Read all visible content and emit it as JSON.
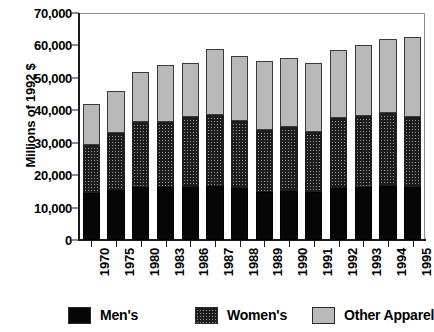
{
  "chart_data": {
    "type": "bar",
    "subtype": "stacked-vertical",
    "title": "",
    "xlabel": "",
    "ylabel": "Millions of 1992 $",
    "ylim": [
      0,
      70000
    ],
    "ytick_step": 10000,
    "ytick_labels": [
      "70,000",
      "60,000",
      "50,000",
      "40,000",
      "30,000",
      "20,000",
      "10,000",
      "0"
    ],
    "ytick_values": [
      70000,
      60000,
      50000,
      40000,
      30000,
      20000,
      10000,
      0
    ],
    "grid": false,
    "legend_position": "bottom",
    "categories": [
      "1970",
      "1975",
      "1980",
      "1983",
      "1986",
      "1987",
      "1988",
      "1989",
      "1990",
      "1991",
      "1992",
      "1993",
      "1994",
      "1995"
    ],
    "series": [
      {
        "name": "Men's",
        "pattern": "solid-black",
        "color": "#060606",
        "values": [
          14500,
          15500,
          16400,
          16300,
          16300,
          16800,
          16000,
          14800,
          15100,
          14900,
          16100,
          16300,
          16800,
          16200
        ]
      },
      {
        "name": "Women's",
        "pattern": "crosshatch",
        "color": "#9a9a9a",
        "values": [
          14900,
          17500,
          20100,
          20200,
          21700,
          21800,
          20800,
          19000,
          19900,
          18500,
          21500,
          21800,
          22400,
          21800
        ]
      },
      {
        "name": "Other Apparel",
        "pattern": "solid-lightgray",
        "color": "#b9b9b9",
        "values": [
          12400,
          13000,
          15300,
          17500,
          16500,
          20400,
          20000,
          21400,
          21000,
          21200,
          20900,
          21900,
          22800,
          24500
        ]
      }
    ],
    "totals": [
      41800,
      46000,
      51800,
      54000,
      54500,
      59000,
      56800,
      55200,
      56000,
      54600,
      58500,
      60000,
      62000,
      62500
    ]
  },
  "legend": {
    "items": [
      {
        "label": "Men's"
      },
      {
        "label": "Women's"
      },
      {
        "label": "Other Apparel"
      }
    ]
  }
}
